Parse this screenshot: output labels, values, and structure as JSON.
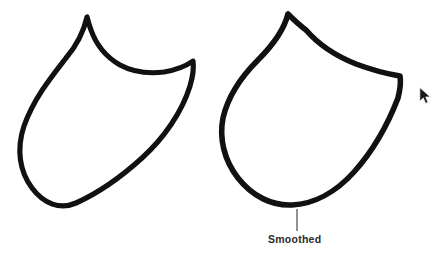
{
  "figure": {
    "background_color": "#ffffff",
    "stroke_color": "#111111",
    "width": 441,
    "height": 259,
    "shapes": [
      {
        "id": "unsmoothed-shape",
        "name": "rough-path-shape",
        "stroke_width": 5.2,
        "path": "M 87 17 C 84 30 78 44 66 58 C 52 76 34 98 24 126 C 16 150 20 172 32 188 C 44 204 60 210 76 203 C 96 194 120 178 142 158 C 164 138 182 112 190 86 C 193 76 194 68 193 61 C 186 66 176 70 164 72 C 148 74 133 72 120 65 C 106 57 96 44 91 30 C 89 25 88 21 87 17 Z"
      },
      {
        "id": "smoothed-shape",
        "name": "smooth-path-shape",
        "stroke_width": 5.6,
        "path": "M 288 14 C 284 30 272 46 258 60 C 242 76 228 96 223 118 C 219 138 224 160 238 178 C 252 196 272 206 292 205 C 314 204 336 192 354 172 C 372 152 388 124 398 98 C 400 90 401 82 400 76 C 388 74 372 70 356 64 C 336 56 318 44 306 30 C 298 24 292 18 288 14 Z"
      }
    ],
    "callout": {
      "label": "Smoothed",
      "label_color": "#2b2b2b",
      "leader_line_color": "#3a3a3a",
      "leader_x": 297,
      "leader_y_top": 209,
      "leader_y_bottom": 231,
      "label_x": 268,
      "label_y": 234
    },
    "cursor": {
      "name": "mouse-pointer",
      "x": 419,
      "y": 87,
      "color": "#1a1a1a"
    }
  }
}
